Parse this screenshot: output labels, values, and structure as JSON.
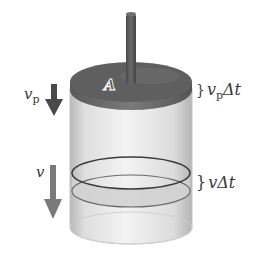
{
  "figure": {
    "labels": {
      "area": "A",
      "piston_velocity_symbol": "v",
      "piston_velocity_subscript": "p",
      "fluid_velocity_symbol": "v",
      "piston_displacement_symbol": "v",
      "piston_displacement_subscript": "p",
      "piston_displacement_suffix": "Δt",
      "fluid_displacement_symbol": "v",
      "fluid_displacement_suffix": "Δt",
      "brace": "}"
    },
    "colors": {
      "piston": "#5c5c5c",
      "piston_edge": "#6e6e6e",
      "rod": "#575757",
      "cylinder_fill": "#e6e6e6",
      "cylinder_edge": "#bdbdbd",
      "band_fill": "#cfcfcf",
      "band_line": "#3c3c3c",
      "arrow_piston": "#4a4a4a",
      "arrow_fluid": "#7a7a7a",
      "text": "#3a3a3a"
    }
  }
}
